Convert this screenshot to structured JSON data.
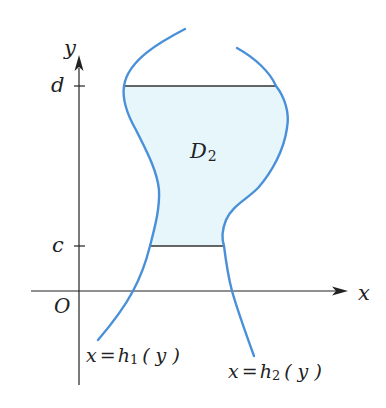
{
  "diagram": {
    "type": "region-between-curves",
    "axes": {
      "x_label": "x",
      "y_label": "y",
      "origin_label": "O"
    },
    "ticks": {
      "upper": "d",
      "lower": "c"
    },
    "region": {
      "name": "D",
      "subscript": "2"
    },
    "curves": [
      {
        "name": "left-boundary",
        "label_lhs": "x",
        "label_eq": "=",
        "label_fn": "h",
        "label_sub": "1",
        "label_arg": "( y )"
      },
      {
        "name": "right-boundary",
        "label_lhs": "x",
        "label_eq": "=",
        "label_fn": "h",
        "label_sub": "2",
        "label_arg": "( y )"
      }
    ],
    "colors": {
      "curve": "#4a90d9",
      "fill": "#e6f6fb",
      "axis": "#222222",
      "boundary_line": "#333333"
    }
  }
}
